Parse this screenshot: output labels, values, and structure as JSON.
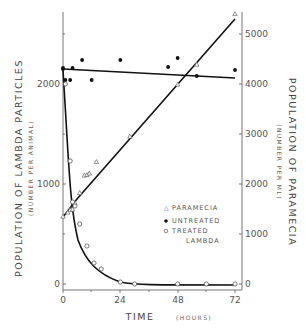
{
  "chart_data": {
    "type": "line",
    "title": "",
    "xlabel": "TIME",
    "xlabel_unit": "(HOURS)",
    "ylabel_left": "POPULATION OF LAMBDA PARTICLES",
    "ylabel_left_unit": "(NUMBER PER ANIMAL)",
    "ylabel_right": "POPULATION OF PARAMECIA",
    "ylabel_right_unit": "(NUMBER PER ML)",
    "x_ticks": [
      "0",
      "24",
      "48",
      "72"
    ],
    "xlim": [
      0,
      72
    ],
    "y_left_ticks": [
      "0",
      "1000",
      "2000"
    ],
    "ylim_left": [
      0,
      2500
    ],
    "y_right_ticks": [
      "0",
      "1000",
      "2000",
      "3000",
      "4000",
      "5000"
    ],
    "ylim_right": [
      0,
      5500
    ],
    "grid": false,
    "legend_position": "lower right (inside plot)",
    "legend": [
      {
        "marker": "△",
        "label": "PARAMECIA"
      },
      {
        "marker": "●",
        "label": "UNTREATED"
      },
      {
        "marker": "○",
        "label": "TREATED LAMBDA"
      }
    ],
    "series": [
      {
        "name": "Paramecia",
        "axis": "right",
        "marker": "triangle",
        "x": [
          0,
          2,
          3,
          4,
          5,
          7,
          9,
          10,
          11,
          14,
          28,
          48,
          56,
          72
        ],
        "values": [
          1350,
          1430,
          1480,
          1490,
          1620,
          1820,
          2170,
          2180,
          2210,
          2440,
          2950,
          3990,
          4390,
          5400
        ],
        "fit_line": [
          [
            0,
            1350
          ],
          [
            6,
            1700
          ],
          [
            72,
            5300
          ]
        ]
      },
      {
        "name": "Untreated",
        "axis": "left",
        "marker": "filled-circle",
        "x": [
          0,
          0,
          1,
          3,
          4,
          8,
          12,
          24,
          44,
          48,
          56,
          72
        ],
        "values": [
          2150,
          2160,
          2040,
          2040,
          2160,
          2240,
          2040,
          2240,
          2170,
          2260,
          2080,
          2140
        ],
        "fit_line": [
          [
            0,
            2150
          ],
          [
            72,
            2060
          ]
        ]
      },
      {
        "name": "Treated Lambda",
        "axis": "left",
        "marker": "open-circle",
        "x": [
          1,
          3,
          4,
          5,
          7,
          10,
          13,
          16,
          24,
          30,
          48,
          60,
          72
        ],
        "values": [
          2000,
          1230,
          820,
          780,
          600,
          380,
          210,
          150,
          20,
          0,
          0,
          0,
          0
        ]
      }
    ]
  }
}
